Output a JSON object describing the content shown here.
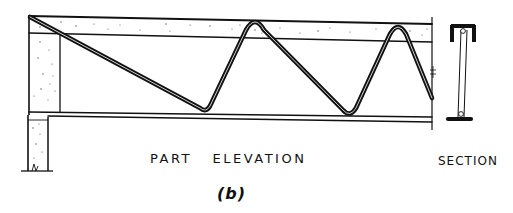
{
  "figure": {
    "caption": "(b)",
    "views": {
      "elevation_label": "PART ELEVATION",
      "section_label": "SECTION"
    }
  },
  "colors": {
    "ink": "#111111",
    "paper": "#ffffff",
    "stipple": "#555555"
  },
  "elements": {
    "top_chord": "concrete-filled top chord (stippled)",
    "bottom_chord": "bottom chord bar",
    "web": "continuous bent-bar zigzag web",
    "end_block": "concrete end block",
    "support": "supporting wall/post",
    "section": "I-shaped section with channel top flange and plate bottom flange"
  }
}
